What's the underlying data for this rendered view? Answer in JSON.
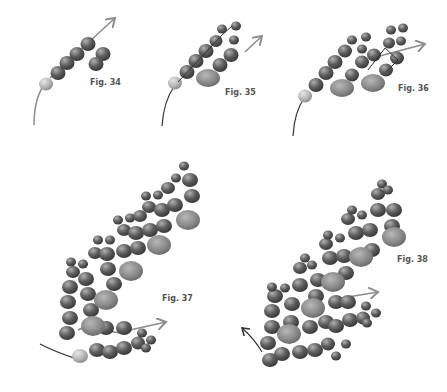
{
  "figures": [
    {
      "id": "fig34",
      "label": "Fig. 34"
    },
    {
      "id": "fig35",
      "label": "Fig. 35"
    },
    {
      "id": "fig36",
      "label": "Fig. 36"
    },
    {
      "id": "fig37",
      "label": "Fig. 37"
    },
    {
      "id": "fig38",
      "label": "Fig. 38"
    }
  ],
  "colors": {
    "bead_dark": "#5e5e5e",
    "bead_light": "#b9b9b9",
    "bead_large": "#8a8a8a",
    "thread": "#333333",
    "arrow": "#8c8c8c"
  }
}
